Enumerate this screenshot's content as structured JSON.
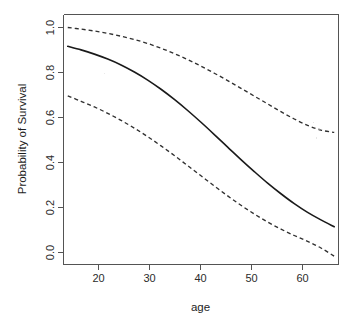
{
  "chart_data": {
    "type": "line",
    "title": "",
    "xlabel": "age",
    "ylabel": "Probability of Survival",
    "xlim": [
      14.2,
      65.8
    ],
    "ylim": [
      -0.02,
      1.04
    ],
    "xticks": [
      20,
      30,
      40,
      50,
      60
    ],
    "xtick_labels": [
      "20",
      "30",
      "40",
      "50",
      "60"
    ],
    "yticks": [
      0.0,
      0.2,
      0.4,
      0.6,
      0.8,
      1.0
    ],
    "ytick_labels": [
      "0.0",
      "0.2",
      "0.4",
      "0.6",
      "0.8",
      "1.0"
    ],
    "grid": false,
    "legend": false,
    "legend_position": "none",
    "x": [
      15,
      17.5,
      20,
      22.5,
      25,
      27.5,
      30,
      32.5,
      35,
      37.5,
      40,
      42.5,
      45,
      47.5,
      50,
      52.5,
      55,
      57.5,
      60,
      62.5,
      65
    ],
    "series": [
      {
        "name": "Upper 95% confidence limit",
        "style": "dashed",
        "color": "#303030",
        "values": [
          0.985,
          0.978,
          0.97,
          0.96,
          0.948,
          0.934,
          0.917,
          0.897,
          0.874,
          0.849,
          0.821,
          0.791,
          0.76,
          0.727,
          0.694,
          0.661,
          0.628,
          0.597,
          0.57,
          0.55,
          0.54
        ]
      },
      {
        "name": "Fitted probability of survival",
        "style": "solid",
        "color": "#1a1a1a",
        "values": [
          0.905,
          0.89,
          0.872,
          0.851,
          0.826,
          0.796,
          0.762,
          0.723,
          0.68,
          0.633,
          0.583,
          0.531,
          0.478,
          0.425,
          0.374,
          0.325,
          0.28,
          0.238,
          0.201,
          0.169,
          0.14
        ]
      },
      {
        "name": "Lower 95% confidence limit",
        "style": "dashed",
        "color": "#303030",
        "values": [
          0.695,
          0.672,
          0.648,
          0.621,
          0.591,
          0.558,
          0.522,
          0.483,
          0.442,
          0.399,
          0.356,
          0.313,
          0.271,
          0.231,
          0.194,
          0.16,
          0.13,
          0.103,
          0.078,
          0.05,
          0.015
        ]
      }
    ],
    "annotations": []
  },
  "axes": {
    "x_title": "age",
    "y_title": "Probability of Survival"
  }
}
